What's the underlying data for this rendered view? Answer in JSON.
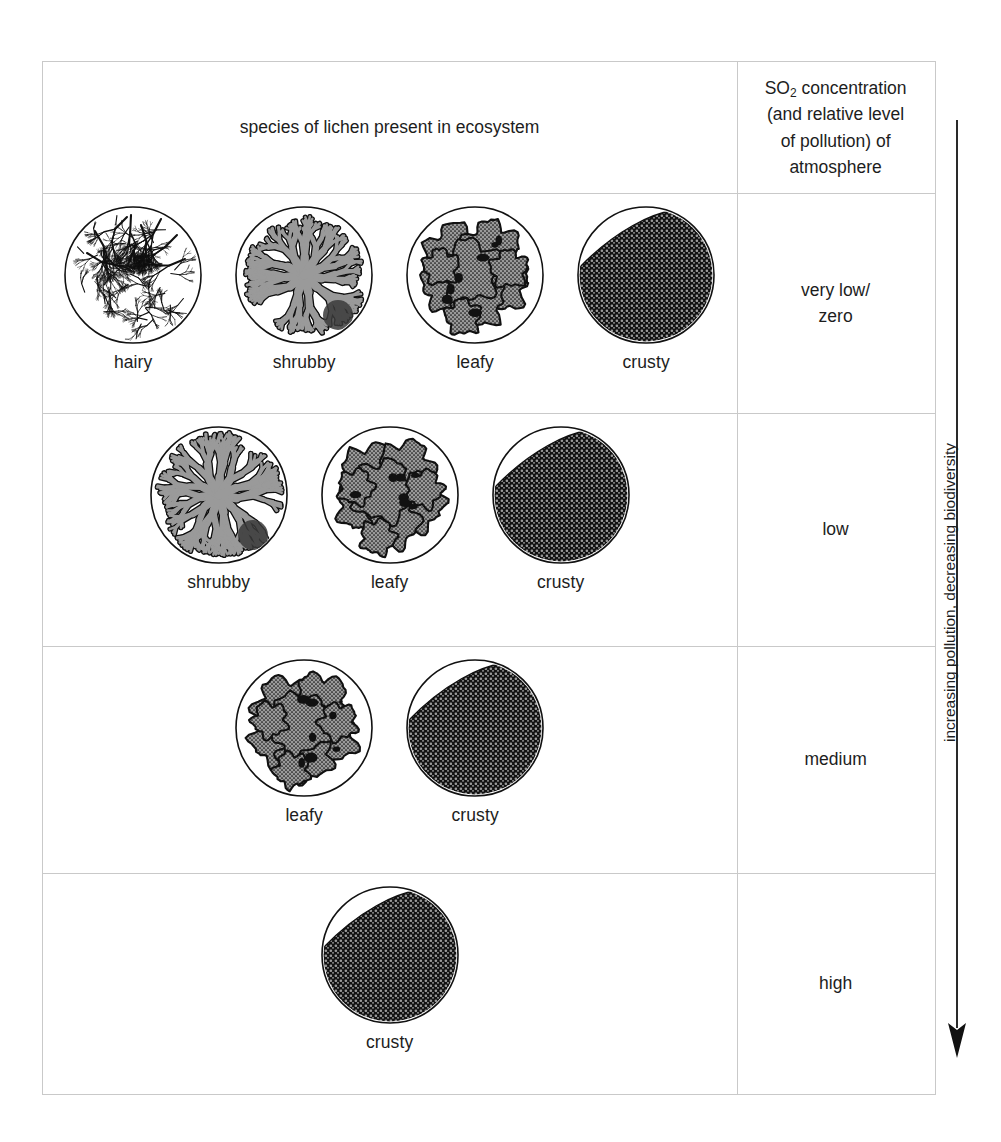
{
  "figure": {
    "arrow_caption": "increasing pollution, decreasing biodiversity",
    "arrow_icon": "down-arrow-icon"
  },
  "table": {
    "headers": {
      "species": "species of lichen present in ecosystem",
      "so2_line1": "SO",
      "so2_sub": "2",
      "so2_line1b": " concentration",
      "so2_line2": "(and relative level",
      "so2_line3": "of pollution) of",
      "so2_line4": "atmosphere"
    },
    "rows": [
      {
        "so2_level": "very low/\nzero",
        "so2_level_l1": "very low/",
        "so2_level_l2": "zero",
        "species": [
          {
            "label": "hairy",
            "icon": "hairy-lichen-icon"
          },
          {
            "label": "shrubby",
            "icon": "shrubby-lichen-icon"
          },
          {
            "label": "leafy",
            "icon": "leafy-lichen-icon"
          },
          {
            "label": "crusty",
            "icon": "crusty-lichen-icon"
          }
        ]
      },
      {
        "so2_level": "low",
        "so2_level_l1": "low",
        "so2_level_l2": "",
        "species": [
          {
            "label": "shrubby",
            "icon": "shrubby-lichen-icon"
          },
          {
            "label": "leafy",
            "icon": "leafy-lichen-icon"
          },
          {
            "label": "crusty",
            "icon": "crusty-lichen-icon"
          }
        ]
      },
      {
        "so2_level": "medium",
        "so2_level_l1": "medium",
        "so2_level_l2": "",
        "species": [
          {
            "label": "leafy",
            "icon": "leafy-lichen-icon"
          },
          {
            "label": "crusty",
            "icon": "crusty-lichen-icon"
          }
        ]
      },
      {
        "so2_level": "high",
        "so2_level_l1": "high",
        "so2_level_l2": "",
        "species": [
          {
            "label": "crusty",
            "icon": "crusty-lichen-icon"
          }
        ]
      }
    ]
  },
  "colors": {
    "border": "#c9c9c9",
    "text": "#1d1d1d",
    "ink": "#111111",
    "lichen_grey": "#9a9a9a",
    "lichen_dark": "#3a3a3a",
    "background": "#ffffff"
  }
}
